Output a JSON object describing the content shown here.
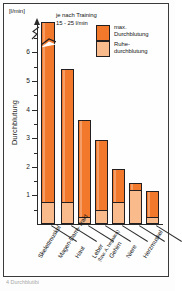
{
  "figure": {
    "unit_label": "[l/min]",
    "y_axis_title": "Durchblutung",
    "caption": "4 Durchblutibi",
    "annotation": {
      "line1": "je nach Training",
      "line2": "15 - 25 l/min"
    },
    "legend": {
      "items": [
        {
          "label_line1": "max.",
          "label_line2": "Durchblutung",
          "color": "#F2782B",
          "key": "max"
        },
        {
          "label_line1": "Ruhe-",
          "label_line2": "durchblutung",
          "color": "#F9BA8C",
          "key": "rest"
        }
      ]
    }
  },
  "chart_data": {
    "type": "bar",
    "title": "",
    "subtitle": "",
    "xlabel": "",
    "ylabel": "Durchblutung",
    "yunit": "[l/min]",
    "ylim": [
      0,
      7
    ],
    "yticks": [
      1,
      2,
      3,
      4,
      5,
      6
    ],
    "ytick_labels": [
      "1",
      "2",
      "3",
      "4",
      "5",
      "6"
    ],
    "minor_tick_step": 0.5,
    "grid": false,
    "axis_break": true,
    "axis_break_note": "y-Achse und erster Balken unterbrochen",
    "legend_position": "top-right",
    "stacked": true,
    "categories": [
      "Skelettmuskel",
      "Magen-Darm-Trakt",
      "Haut",
      "Leber",
      "Gehirn",
      "Niere",
      "Herzmuskel"
    ],
    "category_sublabels": [
      "",
      "",
      "",
      "(bzw. A. hepatica)",
      "",
      "",
      ""
    ],
    "series": [
      {
        "name": "max. Durchblutung",
        "color": "#F2782B",
        "values": [
          22.0,
          5.45,
          3.65,
          2.95,
          1.95,
          1.45,
          1.15
        ],
        "value_labels": [
          "15 - 25",
          "5,45",
          "3,65",
          "2,95",
          "1,95",
          "1,45",
          "1,15"
        ],
        "note": "erster Balken abgeschnitten dargestellt (Achsenbruch)"
      },
      {
        "name": "Ruhedurchblutung",
        "color": "#F9BA8C",
        "values": [
          0.75,
          0.75,
          0.2,
          0.45,
          0.75,
          1.15,
          0.2
        ],
        "value_labels": [
          "0,75",
          "0,75",
          "0,2",
          "0,45",
          "0,75",
          "1,15",
          "0,2"
        ]
      }
    ],
    "annotations": [
      {
        "text": "je nach Training 15 - 25 l/min",
        "target_category": "Skelettmuskel"
      }
    ]
  },
  "geometry": {
    "baseline_y": 224,
    "px_per_unit": 28.6,
    "bars": [
      {
        "left": 41,
        "width": 14,
        "top": 22,
        "rest_h": 21
      },
      {
        "left": 61,
        "width": 13,
        "top": 69,
        "rest_h": 21
      },
      {
        "left": 78,
        "width": 13,
        "top": 120,
        "rest_h": 6
      },
      {
        "left": 95,
        "width": 13,
        "top": 140,
        "rest_h": 13
      },
      {
        "left": 112,
        "width": 13,
        "top": 169,
        "rest_h": 21
      },
      {
        "left": 129,
        "width": 13,
        "top": 183,
        "rest_h": 33
      },
      {
        "left": 146,
        "width": 13,
        "top": 191,
        "rest_h": 6
      }
    ]
  }
}
